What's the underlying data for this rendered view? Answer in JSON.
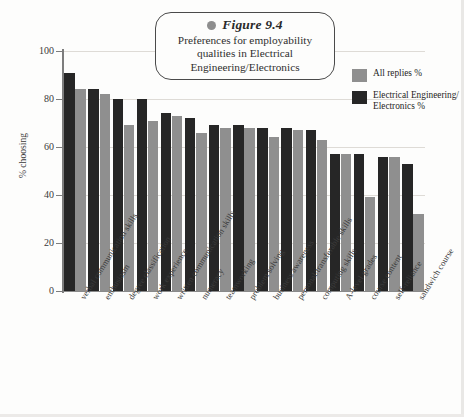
{
  "figure": {
    "number_label": "Figure 9.4",
    "bullet_icon": "bullet-dot-icon",
    "caption": "Preferences for employability qualities in Electrical Engineering/Electronics"
  },
  "legend": {
    "position": "top-right",
    "entries": [
      {
        "label": "All replies %",
        "color": "#8f8f8f",
        "swatch_icon": "legend-swatch-gray"
      },
      {
        "label": "Electrical Engineering/ Electronics %",
        "color": "#262626",
        "swatch_icon": "legend-swatch-black"
      }
    ]
  },
  "axes": {
    "y_title": "% choosing",
    "y_ticks": [
      "100",
      "80",
      "60",
      "40",
      "20",
      "0"
    ],
    "y_min": 0,
    "y_max": 100
  },
  "chart_data": {
    "type": "bar",
    "title": "Preferences for employability qualities in Electrical Engineering/Electronics",
    "xlabel": "",
    "ylabel": "% choosing",
    "ylim": [
      0,
      100
    ],
    "yticks": [
      0,
      20,
      40,
      60,
      80,
      100
    ],
    "grid": true,
    "legend_position": "top-right",
    "orientation": "vertical-grouped",
    "series_draw_order": [
      "Electrical Engineering/ Electronics %",
      "All replies %"
    ],
    "categories": [
      "verbal communication skills",
      "enthusiasm",
      "degree classification",
      "work experience",
      "written communication skills",
      "numeracy",
      "teamworking",
      "problem solving",
      "business awareness",
      "personal/transferable skills",
      "computing skills",
      "A-level grades",
      "course content",
      "self-reliance",
      "sandwich course"
    ],
    "series": [
      {
        "name": "Electrical Engineering/ Electronics %",
        "color": "#262626",
        "values": [
          91,
          84,
          80,
          80,
          74,
          72,
          69,
          69,
          68,
          68,
          67,
          57,
          57,
          56,
          53
        ]
      },
      {
        "name": "All replies %",
        "color": "#8f8f8f",
        "values": [
          84,
          82,
          69,
          71,
          73,
          66,
          68,
          68,
          64,
          67,
          63,
          57,
          39,
          56,
          32
        ]
      }
    ]
  }
}
